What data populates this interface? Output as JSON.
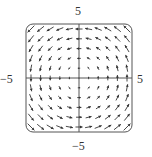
{
  "chart_data": {
    "type": "vector_field",
    "title": "",
    "field": {
      "Fx": "-y",
      "Fy": "x"
    },
    "x_range": [
      -5,
      5
    ],
    "y_range": [
      -5,
      5
    ],
    "grid": {
      "x_start": -5,
      "x_end": 5,
      "y_start": -5,
      "y_end": 5,
      "step": 1
    },
    "axis_labels": {
      "top": "5",
      "bottom": "−5",
      "left": "−5",
      "right": "5"
    },
    "xlabel": "",
    "ylabel": "",
    "frame": "rounded-square",
    "colors": {
      "arrows": "#333333",
      "axes": "#555555",
      "frame": "#555555"
    }
  },
  "labels": {
    "top": "5",
    "bottom": "−5",
    "left": "−5",
    "right": "5"
  }
}
